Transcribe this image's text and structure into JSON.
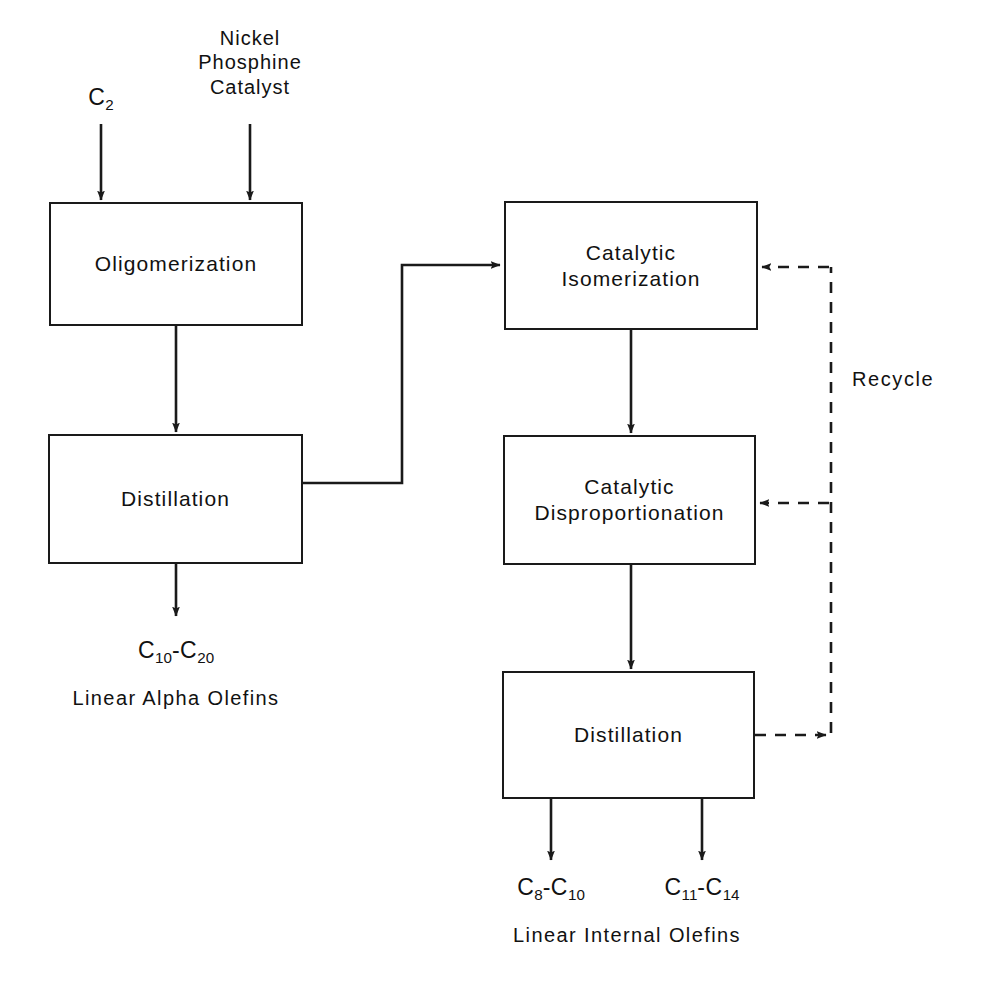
{
  "diagram": {
    "type": "process-flow-diagram",
    "background_color": "#ffffff",
    "line_color": "#1a1a1a",
    "text_color": "#111111"
  },
  "units": [
    {
      "id": "oligomerization",
      "label": "Oligomerization",
      "x": 49,
      "y": 202,
      "w": 254,
      "h": 124
    },
    {
      "id": "left-distillation",
      "label": "Distillation",
      "x": 48,
      "y": 434,
      "w": 255,
      "h": 130
    },
    {
      "id": "isomerization",
      "label": "Catalytic\nIsomerization",
      "x": 504,
      "y": 201,
      "w": 254,
      "h": 129
    },
    {
      "id": "disproportionation",
      "label": "Catalytic\nDisproportionation",
      "x": 503,
      "y": 435,
      "w": 253,
      "h": 130
    },
    {
      "id": "right-distillation",
      "label": "Distillation",
      "x": 502,
      "y": 671,
      "w": 253,
      "h": 128
    }
  ],
  "feeds": {
    "ethylene": {
      "label": "C₂",
      "text": "C",
      "sub": "2",
      "x": 101,
      "y": 88
    },
    "catalyst": {
      "label": "Nickel\nPhosphine\nCatalyst",
      "x": 250,
      "y": 28
    }
  },
  "products": {
    "alpha_olefins": {
      "formula_text": "C",
      "formula_sub1": "10",
      "formula_dash": "-C",
      "formula_sub2": "20",
      "formula": "C10-C20",
      "caption": "Linear Alpha Olefins",
      "x": 176,
      "formula_y": 638,
      "caption_y": 688
    },
    "internal_light": {
      "formula_text": "C",
      "formula_sub1": "8",
      "formula_dash": "-C",
      "formula_sub2": "10",
      "formula": "C8-C10",
      "x": 551,
      "formula_y": 875
    },
    "internal_heavy": {
      "formula_text": "C",
      "formula_sub1": "11",
      "formula_dash": "-C",
      "formula_sub2": "14",
      "formula": "C11-C14",
      "x": 702,
      "formula_y": 875
    },
    "internal_caption": {
      "caption": "Linear Internal Olefins",
      "x": 627,
      "y": 925
    }
  },
  "recycle": {
    "label": "Recycle",
    "x": 852,
    "y": 368,
    "line_x": 831,
    "top_y": 267,
    "bottom_y": 735,
    "branch_y": 503,
    "style": "dashed"
  },
  "connectors": {
    "distillate_transfer": {
      "from": "left-distillation",
      "to": "isomerization",
      "path": "M303,483 L402,483 L402,265 L500,265"
    }
  }
}
